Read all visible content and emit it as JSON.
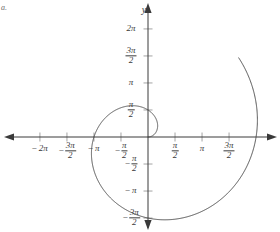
{
  "figure": {
    "label": "a.",
    "caption_axis_y": "y"
  },
  "chart_data": {
    "type": "line",
    "title": "",
    "subtitle": "",
    "xlabel": "",
    "ylabel": "y",
    "curve_name": "Archimedean spiral r = θ",
    "polar": true,
    "grid": false,
    "legend": null,
    "xlim": [
      -7.33,
      5.76
    ],
    "ylim": [
      -5.24,
      6.81
    ],
    "origin_px": [
      148,
      137
    ],
    "px_per_unit": 17.2,
    "x_ticks": [
      {
        "value": -6.2832,
        "label_parts": {
          "sign": "−",
          "num": "2π",
          "den": ""
        }
      },
      {
        "value": -4.7124,
        "label_parts": {
          "sign": "−",
          "num": "3π",
          "den": "2"
        }
      },
      {
        "value": -3.1416,
        "label_parts": {
          "sign": "−",
          "num": "π",
          "den": ""
        }
      },
      {
        "value": -1.5708,
        "label_parts": {
          "sign": "−",
          "num": "π",
          "den": "2"
        }
      },
      {
        "value": 1.5708,
        "label_parts": {
          "sign": "",
          "num": "π",
          "den": "2"
        }
      },
      {
        "value": 3.1416,
        "label_parts": {
          "sign": "",
          "num": "π",
          "den": ""
        }
      },
      {
        "value": 4.7124,
        "label_parts": {
          "sign": "",
          "num": "3π",
          "den": "2"
        }
      }
    ],
    "y_ticks": [
      {
        "value": 6.2832,
        "label_parts": {
          "sign": "",
          "num": "2π",
          "den": ""
        }
      },
      {
        "value": 4.7124,
        "label_parts": {
          "sign": "",
          "num": "3π",
          "den": "2"
        }
      },
      {
        "value": 3.1416,
        "label_parts": {
          "sign": "",
          "num": "π",
          "den": ""
        }
      },
      {
        "value": 1.5708,
        "label_parts": {
          "sign": "",
          "num": "π",
          "den": "2"
        }
      },
      {
        "value": -1.5708,
        "label_parts": {
          "sign": "−",
          "num": "π",
          "den": "2"
        }
      },
      {
        "value": -3.1416,
        "label_parts": {
          "sign": "−",
          "num": "π",
          "den": ""
        }
      },
      {
        "value": -4.7124,
        "label_parts": {
          "sign": "−",
          "num": "3π",
          "den": "2"
        }
      }
    ],
    "theta_start": 0,
    "theta_end": 7.0,
    "series": [
      {
        "name": "r = θ",
        "points_polar": [
          [
            0.0,
            0.0
          ],
          [
            0.35,
            0.35
          ],
          [
            0.7,
            0.7
          ],
          [
            1.05,
            1.05
          ],
          [
            1.4,
            1.4
          ],
          [
            1.75,
            1.75
          ],
          [
            2.09,
            2.09
          ],
          [
            2.44,
            2.44
          ],
          [
            2.79,
            2.79
          ],
          [
            3.14,
            3.14
          ],
          [
            3.49,
            3.49
          ],
          [
            3.84,
            3.84
          ],
          [
            4.19,
            4.19
          ],
          [
            4.54,
            4.54
          ],
          [
            4.89,
            4.89
          ],
          [
            5.24,
            5.24
          ],
          [
            5.59,
            5.59
          ],
          [
            5.93,
            5.93
          ],
          [
            6.28,
            6.28
          ],
          [
            6.63,
            6.63
          ],
          [
            6.98,
            6.98
          ]
        ]
      }
    ],
    "axis_arrows": [
      "left",
      "right",
      "up",
      "down"
    ],
    "colors": {
      "curve": "#4a4a4a",
      "axis": "#3a3a3a",
      "tick": "#9a9a9a",
      "label": "#3a3a3a",
      "figure_label": "#6b6b6b",
      "background": "#ffffff"
    }
  }
}
